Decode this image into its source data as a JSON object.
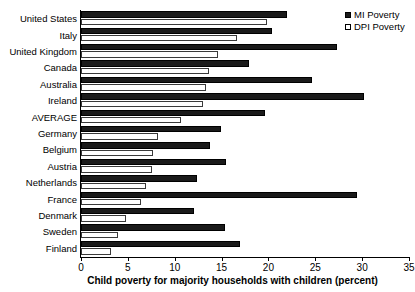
{
  "chart_data": {
    "type": "bar",
    "orientation": "horizontal",
    "title": "",
    "xlabel": "Child poverty for majority households with children (percent)",
    "ylabel": "",
    "xlim": [
      0,
      35
    ],
    "xticks": [
      0,
      5,
      10,
      15,
      20,
      25,
      30,
      35
    ],
    "grid": false,
    "legend_position": "top-right",
    "categories": [
      "United States",
      "Italy",
      "United Kingdom",
      "Canada",
      "Australia",
      "Ireland",
      "AVERAGE",
      "Germany",
      "Belgium",
      "Austria",
      "Netherlands",
      "France",
      "Denmark",
      "Sweden",
      "Finland"
    ],
    "series": [
      {
        "name": "MI Poverty",
        "color": "#1a1a1a",
        "values": [
          22.0,
          20.4,
          27.3,
          17.9,
          24.7,
          30.2,
          19.6,
          14.9,
          13.8,
          15.5,
          12.4,
          29.5,
          12.1,
          15.4,
          17.0
        ]
      },
      {
        "name": "DPI Poverty",
        "color": "#ffffff",
        "values": [
          19.9,
          16.6,
          14.6,
          13.7,
          13.3,
          13.0,
          10.7,
          8.2,
          7.7,
          7.6,
          6.9,
          6.4,
          4.8,
          3.9,
          3.2
        ]
      }
    ]
  },
  "legend": {
    "items": [
      {
        "label": "MI Poverty",
        "swatch": "filled-square-icon"
      },
      {
        "label": "DPI Poverty",
        "swatch": "open-square-icon"
      }
    ]
  }
}
